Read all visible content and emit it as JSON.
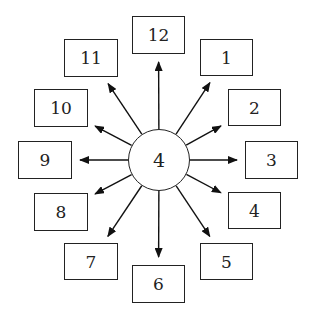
{
  "diagram": {
    "center": {
      "label": "4",
      "cx": 159,
      "cy": 160,
      "r": 31
    },
    "nodes": [
      {
        "label": "12",
        "x": 132,
        "y": 16,
        "w": 53,
        "h": 38
      },
      {
        "label": "1",
        "x": 200,
        "y": 39,
        "w": 53,
        "h": 37
      },
      {
        "label": "2",
        "x": 228,
        "y": 89,
        "w": 53,
        "h": 37
      },
      {
        "label": "3",
        "x": 245,
        "y": 141,
        "w": 53,
        "h": 38
      },
      {
        "label": "4",
        "x": 228,
        "y": 192,
        "w": 53,
        "h": 37
      },
      {
        "label": "5",
        "x": 200,
        "y": 243,
        "w": 53,
        "h": 37
      },
      {
        "label": "6",
        "x": 132,
        "y": 265,
        "w": 53,
        "h": 38
      },
      {
        "label": "7",
        "x": 64,
        "y": 243,
        "w": 54,
        "h": 37
      },
      {
        "label": "8",
        "x": 34,
        "y": 193,
        "w": 54,
        "h": 38
      },
      {
        "label": "9",
        "x": 18,
        "y": 141,
        "w": 54,
        "h": 38
      },
      {
        "label": "10",
        "x": 34,
        "y": 89,
        "w": 54,
        "h": 38
      },
      {
        "label": "11",
        "x": 64,
        "y": 39,
        "w": 54,
        "h": 38
      }
    ]
  }
}
